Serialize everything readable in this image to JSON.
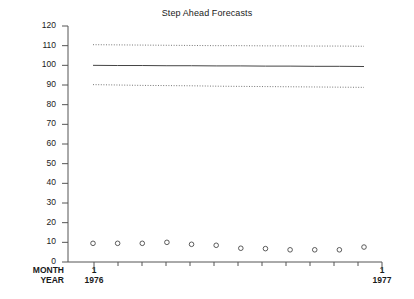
{
  "chart_data": {
    "type": "line",
    "title": "Step Ahead Forecasts",
    "xlabel": "",
    "ylabel": "",
    "ylim": [
      0,
      120
    ],
    "ytick_labels": [
      "120",
      "110",
      "100",
      "90",
      "80",
      "70",
      "60",
      "50",
      "40",
      "30",
      "20",
      "10",
      "0"
    ],
    "ytick_values": [
      120,
      110,
      100,
      90,
      80,
      70,
      60,
      50,
      40,
      30,
      20,
      10,
      0
    ],
    "grid": false,
    "legend": "none",
    "x_axis": {
      "row_labels": [
        "MONTH",
        "YEAR"
      ],
      "major_ticks": [
        {
          "month": "1",
          "year": "1976"
        },
        {
          "month": "1",
          "year": "1977"
        }
      ],
      "minor_tick_count": 13
    },
    "x": [
      1,
      2,
      3,
      4,
      5,
      6,
      7,
      8,
      9,
      10,
      11,
      12
    ],
    "series": [
      {
        "name": "Upper Forecast Limit",
        "style": "dotted",
        "values": [
          110.5,
          110.4,
          110.3,
          110.2,
          110.1,
          110.0,
          110.0,
          109.9,
          109.9,
          109.8,
          109.8,
          109.7
        ]
      },
      {
        "name": "Forecast",
        "style": "solid",
        "values": [
          100.0,
          99.9,
          99.9,
          99.8,
          99.8,
          99.7,
          99.7,
          99.6,
          99.6,
          99.5,
          99.5,
          99.4
        ]
      },
      {
        "name": "Lower Forecast Limit",
        "style": "dotted",
        "values": [
          90.2,
          90.0,
          89.8,
          89.7,
          89.6,
          89.4,
          89.3,
          89.2,
          89.1,
          89.0,
          88.9,
          88.8
        ]
      },
      {
        "name": "Observed",
        "style": "open-circle-markers",
        "values": [
          9.5,
          9.5,
          9.5,
          10.0,
          9.0,
          8.5,
          7.0,
          6.8,
          6.2,
          6.2,
          6.2,
          7.6
        ]
      }
    ]
  }
}
